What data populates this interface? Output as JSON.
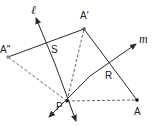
{
  "diagram": {
    "type": "geometry-reflection",
    "colors": {
      "line": "#2a2a2a",
      "dashed": "#555555",
      "point": "#333333",
      "background": "#ffffff"
    },
    "points": {
      "A": {
        "label": "A",
        "x": 137,
        "y": 100
      },
      "A_prime": {
        "label": "A′",
        "x": 84,
        "y": 29
      },
      "A_double_prime": {
        "label": "A″",
        "x": 8,
        "y": 57
      },
      "P": {
        "label": "P",
        "x": 67,
        "y": 101
      },
      "S": {
        "label": "S"
      },
      "R": {
        "label": "R"
      }
    },
    "lines": {
      "l": {
        "label": "ℓ"
      },
      "m": {
        "label": "m"
      }
    }
  }
}
